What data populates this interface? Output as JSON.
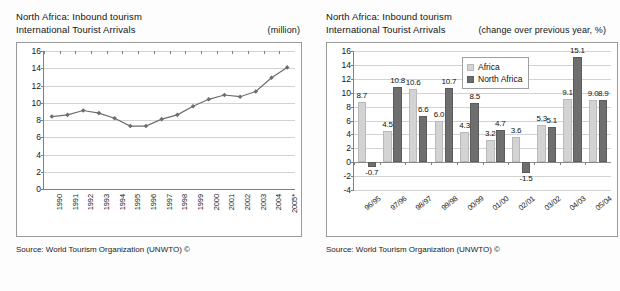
{
  "left_panel": {
    "title_line1": "North Africa: Inbound tourism",
    "title_line2": "International Tourist Arrivals",
    "unit": "(million)",
    "source": "Source: World Tourism Organization (UNWTO) ©"
  },
  "right_panel": {
    "title_line1": "North Africa: Inbound tourism",
    "title_line2": "International Tourist Arrivals",
    "unit": "(change over previous year, %)",
    "source": "Source: World Tourism Organization (UNWTO) ©"
  },
  "chart_data": [
    {
      "type": "line",
      "title": "North Africa: Inbound tourism — International Tourist Arrivals",
      "xlabel": "",
      "ylabel": "(million)",
      "ylim": [
        0,
        16
      ],
      "yticks": [
        0,
        2,
        4,
        6,
        8,
        10,
        12,
        14,
        16
      ],
      "grid": true,
      "legend": "none",
      "marker": "diamond",
      "series_color": "#6d6d6d",
      "categories": [
        "1990",
        "1991",
        "1992",
        "1993",
        "1994",
        "1995",
        "1996",
        "1997",
        "1998",
        "1999",
        "2000",
        "2001",
        "2002",
        "2003",
        "2004",
        "2005*"
      ],
      "values": [
        8.4,
        8.6,
        9.1,
        8.8,
        8.2,
        7.3,
        7.3,
        8.1,
        8.6,
        9.6,
        10.4,
        10.9,
        10.7,
        11.3,
        12.9,
        14.1
      ]
    },
    {
      "type": "bar",
      "title": "North Africa: Inbound tourism — International Tourist Arrivals",
      "xlabel": "",
      "ylabel": "(change over previous year, %)",
      "ylim": [
        -4,
        16
      ],
      "yticks": [
        -4,
        -2,
        0,
        2,
        4,
        6,
        8,
        10,
        12,
        14,
        16
      ],
      "grid": true,
      "legend": "inside-top-center",
      "categories": [
        "96/95",
        "97/96",
        "98/97",
        "99/98",
        "00/99",
        "01/00",
        "02/01",
        "03/02",
        "04/03",
        "05/04"
      ],
      "series": [
        {
          "name": "Africa",
          "color": "#d3d3d3",
          "values": [
            8.7,
            4.5,
            10.6,
            6.0,
            4.3,
            3.2,
            3.6,
            5.3,
            9.1,
            9.0
          ]
        },
        {
          "name": "North Africa",
          "color": "#6e6e6e",
          "values": [
            -0.7,
            10.8,
            6.6,
            10.7,
            8.5,
            4.7,
            -1.5,
            5.1,
            15.1,
            8.9
          ]
        }
      ]
    }
  ]
}
